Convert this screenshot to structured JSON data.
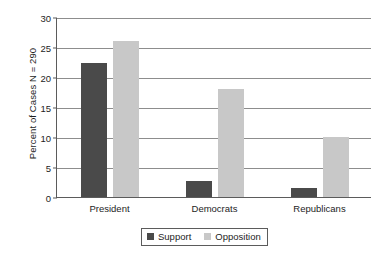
{
  "chart_data": {
    "type": "bar",
    "title": "",
    "xlabel": "",
    "ylabel": "Percent of Cases N = 290",
    "categories": [
      "President",
      "Democrats",
      "Republicans"
    ],
    "series": [
      {
        "name": "Support",
        "color": "#4a4a4a",
        "values": [
          22.3,
          2.7,
          1.5
        ]
      },
      {
        "name": "Opposition",
        "color": "#c8c8c8",
        "values": [
          26.0,
          18.0,
          10.0
        ]
      }
    ],
    "ylim": [
      0,
      30
    ],
    "yticks": [
      0,
      5,
      10,
      15,
      20,
      25,
      30
    ],
    "ytick_labels": [
      "0",
      "5",
      "10",
      "15",
      "20",
      "25",
      "30"
    ],
    "grid": true,
    "legend_position": "bottom"
  },
  "legend": {
    "items": [
      {
        "label": "Support"
      },
      {
        "label": "Opposition"
      }
    ]
  }
}
